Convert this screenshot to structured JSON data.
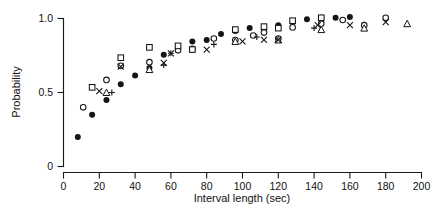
{
  "chart_data": {
    "type": "scatter",
    "title": "",
    "xlabel": "Interval length (sec)",
    "ylabel": "Probability",
    "xlim": [
      0,
      200
    ],
    "ylim": [
      0,
      1.0
    ],
    "xticks": [
      0,
      20,
      40,
      60,
      80,
      100,
      120,
      140,
      160,
      180,
      200
    ],
    "xtick_labels": [
      "0",
      "20",
      "40",
      "60",
      "80",
      "100",
      "120",
      "140",
      "160",
      "180",
      "200"
    ],
    "yticks": [
      0,
      0.5,
      1.0
    ],
    "ytick_labels": [
      "0",
      "0.5",
      "1.0"
    ],
    "grid": false,
    "legend": "none",
    "series": [
      {
        "name": "filled-circle",
        "marker": "filled-circle",
        "color": "#151515",
        "points": [
          [
            8,
            0.2
          ],
          [
            16,
            0.35
          ],
          [
            24,
            0.45
          ],
          [
            32,
            0.555
          ],
          [
            40,
            0.615
          ],
          [
            48,
            0.665
          ],
          [
            56,
            0.755
          ],
          [
            64,
            0.805
          ],
          [
            72,
            0.845
          ],
          [
            80,
            0.855
          ],
          [
            88,
            0.895
          ],
          [
            96,
            0.915
          ],
          [
            104,
            0.935
          ],
          [
            112,
            0.925
          ],
          [
            120,
            0.955
          ],
          [
            128,
            0.975
          ],
          [
            136,
            0.995
          ],
          [
            144,
            1.005
          ],
          [
            152,
            1.005
          ],
          [
            160,
            1.01
          ]
        ]
      },
      {
        "name": "open-circle",
        "marker": "open-circle",
        "color": "#151515",
        "points": [
          [
            11,
            0.4
          ],
          [
            24,
            0.585
          ],
          [
            32,
            0.68
          ],
          [
            48,
            0.705
          ],
          [
            64,
            0.785
          ],
          [
            72,
            0.795
          ],
          [
            84,
            0.865
          ],
          [
            96,
            0.855
          ],
          [
            106,
            0.885
          ],
          [
            112,
            0.905
          ],
          [
            120,
            0.865
          ],
          [
            128,
            0.94
          ],
          [
            144,
            0.965
          ],
          [
            156,
            0.99
          ],
          [
            168,
            0.955
          ],
          [
            180,
            1.005
          ]
        ]
      },
      {
        "name": "open-square",
        "marker": "open-square",
        "color": "#151515",
        "points": [
          [
            16,
            0.535
          ],
          [
            32,
            0.735
          ],
          [
            48,
            0.805
          ],
          [
            64,
            0.815
          ],
          [
            72,
            0.79
          ],
          [
            96,
            0.925
          ],
          [
            112,
            0.945
          ],
          [
            120,
            0.935
          ],
          [
            128,
            0.985
          ],
          [
            144,
            1.005
          ]
        ]
      },
      {
        "name": "open-triangle",
        "marker": "open-triangle",
        "color": "#151515",
        "points": [
          [
            24,
            0.5
          ],
          [
            48,
            0.655
          ],
          [
            96,
            0.845
          ],
          [
            120,
            0.855
          ],
          [
            144,
            0.925
          ],
          [
            168,
            0.935
          ],
          [
            192,
            0.965
          ]
        ]
      },
      {
        "name": "cross-x",
        "marker": "x",
        "color": "#151515",
        "points": [
          [
            20,
            0.51
          ],
          [
            32,
            0.675
          ],
          [
            56,
            0.7
          ],
          [
            60,
            0.765
          ],
          [
            80,
            0.79
          ],
          [
            100,
            0.845
          ],
          [
            112,
            0.855
          ],
          [
            120,
            0.855
          ],
          [
            142,
            0.955
          ],
          [
            160,
            0.955
          ],
          [
            180,
            0.975
          ]
        ]
      },
      {
        "name": "plus",
        "marker": "plus",
        "color": "#151515",
        "points": [
          [
            27,
            0.5
          ],
          [
            56,
            0.685
          ],
          [
            60,
            0.765
          ],
          [
            84,
            0.825
          ],
          [
            108,
            0.875
          ],
          [
            140,
            0.935
          ]
        ]
      }
    ]
  },
  "axes": {
    "y_title": "Probability",
    "x_title": "Interval length (sec)"
  }
}
